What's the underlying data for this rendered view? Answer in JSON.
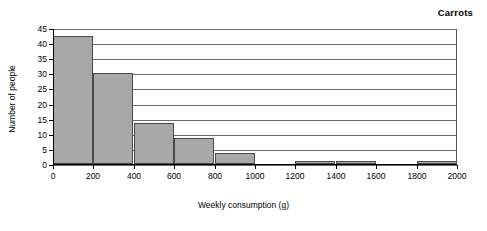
{
  "chart_data": {
    "type": "bar",
    "title": "Carrots",
    "xlabel": "Weekly consumption (g)",
    "ylabel": "Number of people",
    "xlim": [
      0,
      2000
    ],
    "ylim": [
      0,
      45
    ],
    "grid": true,
    "legend": "none",
    "bin_width": 200,
    "xticks": [
      0,
      200,
      400,
      600,
      800,
      1000,
      1200,
      1400,
      1600,
      1800,
      2000
    ],
    "yticks": [
      0,
      5,
      10,
      15,
      20,
      25,
      30,
      35,
      40,
      45
    ],
    "categories": [
      "0-200",
      "200-400",
      "400-600",
      "600-800",
      "800-1000",
      "1000-1200",
      "1200-1400",
      "1400-1600",
      "1600-1800",
      "1800-2000"
    ],
    "bin_starts": [
      0,
      200,
      400,
      600,
      800,
      1000,
      1200,
      1400,
      1600,
      1800
    ],
    "values": [
      42.5,
      30,
      13.5,
      8.5,
      3.5,
      0,
      1,
      1,
      0,
      1
    ],
    "bar_color": "#a8a8a8",
    "bar_edge_color": "#4a4a4a",
    "gridline_color": "#6b6b6b",
    "axis_color": "#000000"
  }
}
